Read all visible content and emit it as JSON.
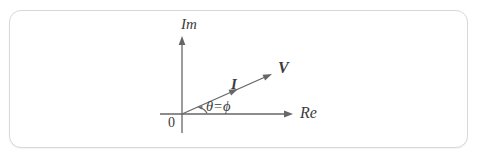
{
  "diagram": {
    "type": "phasor-diagram",
    "labels": {
      "im_axis": "Im",
      "re_axis": "Re",
      "origin": "0",
      "current_phasor": "I",
      "voltage_phasor": "V",
      "angle": "θ=ϕ"
    },
    "colors": {
      "line": "#666666",
      "text": "#3c3c3c",
      "border": "#d8d8d8",
      "background": "#ffffff"
    }
  }
}
